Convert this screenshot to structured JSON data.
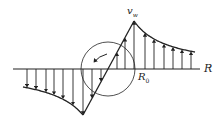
{
  "diagram": {
    "type": "vortex velocity profile (Rankine vortex)",
    "labels": {
      "peak_velocity": "v",
      "peak_velocity_sub": "w",
      "core_radius": "R",
      "core_radius_sub": "0",
      "axis": "R"
    },
    "colors": {
      "stroke": "#222222",
      "background": "#ffffff"
    },
    "elements": {
      "axis": {
        "x1": 13,
        "y": 69,
        "x2": 200
      },
      "core_line": {
        "from": [
          83,
          115
        ],
        "to": [
          134,
          21
        ]
      },
      "core_circle": {
        "cx": 108,
        "cy": 69,
        "r": 27
      },
      "right_decay_curve": {
        "from": [
          134,
          21
        ],
        "to": [
          195,
          52
        ]
      },
      "left_decay_curve": {
        "from": [
          23,
          87
        ],
        "to": [
          83,
          115
        ]
      },
      "upward_arrows_x": [
        117,
        125,
        134,
        145,
        154,
        164,
        173,
        182,
        191
      ],
      "downward_arrows_x": [
        27,
        36,
        46,
        54,
        63,
        73,
        83,
        92,
        101
      ],
      "rotation_arrow": "counterclockwise"
    }
  }
}
